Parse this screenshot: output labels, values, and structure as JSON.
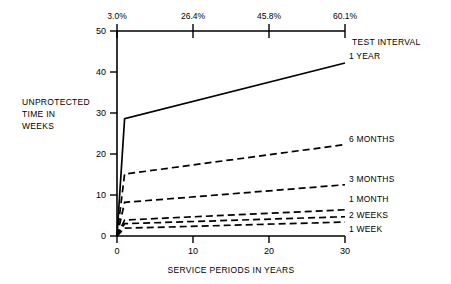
{
  "chart_data": {
    "type": "line",
    "title": "",
    "xlabel": "SERVICE PERIODS IN YEARS",
    "ylabel": "UNPROTECTED TIME IN WEEKS",
    "ylabel_lines": [
      "UNPROTECTED",
      "TIME IN",
      "WEEKS"
    ],
    "xlim": [
      0,
      30
    ],
    "ylim": [
      0,
      50
    ],
    "xticks": [
      0,
      10,
      20,
      30
    ],
    "xtick_labels": [
      "0",
      "10",
      "20",
      "30"
    ],
    "yticks": [
      0,
      10,
      20,
      30,
      40,
      50
    ],
    "ytick_labels": [
      "0",
      "10",
      "20",
      "30",
      "40",
      "50"
    ],
    "grid": false,
    "legend_position": "right-inline",
    "secondary_axis": {
      "position": "top",
      "title": "TEST INTERVAL",
      "tick_positions": [
        0,
        10,
        20,
        30
      ],
      "tick_labels": [
        "3.0%",
        "26.4%",
        "45.8%",
        "60.1%"
      ]
    },
    "series": [
      {
        "name": "1 YEAR",
        "style": "solid",
        "label": "1 YEAR",
        "x": [
          0,
          1,
          30
        ],
        "values": [
          0,
          28.6,
          42.2
        ]
      },
      {
        "name": "6 MONTHS",
        "style": "dashed",
        "label": "6 MONTHS",
        "x": [
          0,
          1,
          30
        ],
        "values": [
          0,
          15.1,
          22.3
        ]
      },
      {
        "name": "3 MONTHS",
        "style": "dashed",
        "label": "3 MONTHS",
        "x": [
          0,
          1,
          30
        ],
        "values": [
          0,
          8.2,
          12.5
        ]
      },
      {
        "name": "1 MONTH",
        "style": "dashed",
        "label": "1 MONTH",
        "x": [
          0,
          1,
          30
        ],
        "values": [
          0,
          3.9,
          6.4
        ]
      },
      {
        "name": "2 WEEKS",
        "style": "dashed",
        "label": "2 WEEKS",
        "x": [
          0,
          1,
          30
        ],
        "values": [
          0,
          3.0,
          4.7
        ]
      },
      {
        "name": "1 WEEK",
        "style": "dashed",
        "label": "1 WEEK",
        "x": [
          0,
          1,
          30
        ],
        "values": [
          0,
          1.9,
          3.4
        ]
      }
    ]
  }
}
